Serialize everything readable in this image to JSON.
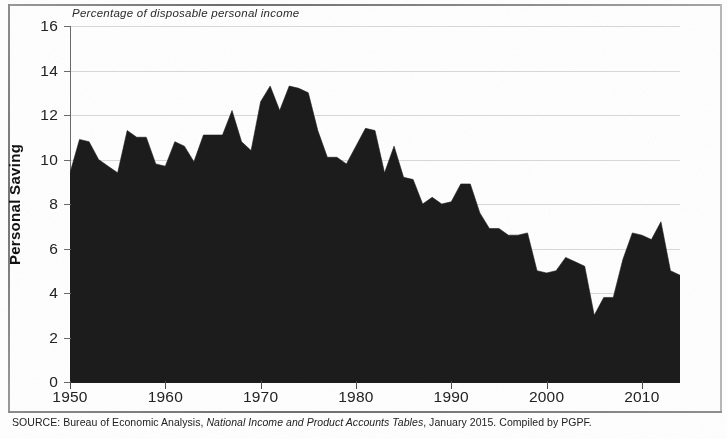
{
  "figure": {
    "subtitle": "Percentage of disposable personal income",
    "y_axis_title": "Personal Saving",
    "source_prefix": "SOURCE: Bureau of Economic Analysis,",
    "source_italic": "National Income and Product Accounts Tables",
    "source_suffix": ", January 2015. Compiled by PGPF.",
    "colors": {
      "area_fill": "#1c1c1c",
      "axis": "#4a4a4a",
      "gridline": "#d9d9d9",
      "text": "#232323",
      "background": "#ffffff",
      "frame": "#8a8a8a"
    }
  },
  "chart_data": {
    "type": "area",
    "title": "",
    "subtitle": "Percentage of disposable personal income",
    "xlabel": "",
    "ylabel": "Personal Saving",
    "ylim": [
      0,
      16
    ],
    "xlim": [
      1950,
      2014
    ],
    "ytick_labels": [
      "0",
      "2",
      "4",
      "6",
      "8",
      "10",
      "12",
      "14",
      "16"
    ],
    "ytick_values": [
      0,
      2,
      4,
      6,
      8,
      10,
      12,
      14,
      16
    ],
    "xtick_labels": [
      "1950",
      "1960",
      "1970",
      "1980",
      "1990",
      "2000",
      "2010"
    ],
    "xtick_values": [
      1950,
      1960,
      1970,
      1980,
      1990,
      2000,
      2010
    ],
    "grid": true,
    "legend": false,
    "series_name": "Personal saving rate",
    "x": [
      1950,
      1951,
      1952,
      1953,
      1954,
      1955,
      1956,
      1957,
      1958,
      1959,
      1960,
      1961,
      1962,
      1963,
      1964,
      1965,
      1966,
      1967,
      1968,
      1969,
      1970,
      1971,
      1972,
      1973,
      1974,
      1975,
      1976,
      1977,
      1978,
      1979,
      1980,
      1981,
      1982,
      1983,
      1984,
      1985,
      1986,
      1987,
      1988,
      1989,
      1990,
      1991,
      1992,
      1993,
      1994,
      1995,
      1996,
      1997,
      1998,
      1999,
      2000,
      2001,
      2002,
      2003,
      2004,
      2005,
      2006,
      2007,
      2008,
      2009,
      2010,
      2011,
      2012,
      2013,
      2014
    ],
    "values": [
      9.4,
      10.9,
      10.8,
      10.0,
      9.7,
      9.4,
      11.3,
      11.0,
      11.0,
      9.8,
      9.7,
      10.8,
      10.6,
      9.9,
      11.1,
      11.1,
      11.1,
      12.2,
      10.8,
      10.4,
      12.6,
      13.3,
      12.2,
      13.3,
      13.2,
      13.0,
      11.3,
      10.1,
      10.1,
      9.8,
      10.6,
      11.4,
      11.3,
      9.4,
      10.6,
      9.2,
      9.1,
      8.0,
      8.3,
      8.0,
      8.1,
      8.9,
      8.9,
      7.6,
      6.9,
      6.9,
      6.6,
      6.6,
      6.7,
      5.0,
      4.9,
      5.0,
      5.6,
      5.4,
      5.2,
      3.0,
      3.8,
      3.8,
      5.5,
      6.7,
      6.6,
      6.4,
      7.2,
      5.0,
      4.8
    ],
    "data_note": "Annual U.S. personal saving as a percentage of disposable personal income, 1950-2014"
  }
}
